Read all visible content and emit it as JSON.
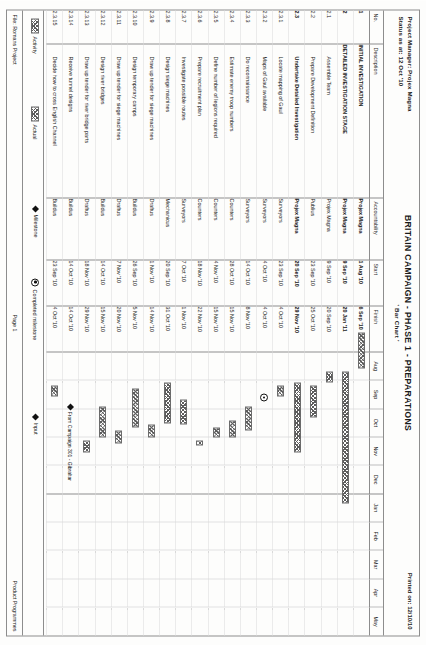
{
  "header": {
    "project_manager": "Project Manager: Projex Magna",
    "status_as_at": "Status as at: 12 Oct '10",
    "title": "BRITAIN CAMPAIGN - PHASE 1 - PREPARATIONS",
    "subtitle": "' Bar Chart '",
    "printed_on": "Printed on: 12/10/10"
  },
  "columns": {
    "no": "No.",
    "description": "Description",
    "accountability": "Accountability",
    "start": "Start",
    "finish": "Finish"
  },
  "timeline": {
    "months": [
      "Aug",
      "Sep",
      "Oct",
      "Nov",
      "Dec",
      "Jan",
      "Feb",
      "Mar",
      "Apr",
      "May"
    ],
    "year_split_after": "Dec"
  },
  "rows": [
    {
      "no": "1",
      "desc": "INITIAL INVESTIGATION",
      "acc": "Projex Magna",
      "start": "1 Aug '10",
      "finish": "6 Sep '10",
      "bold": true,
      "indent": 0
    },
    {
      "no": "2",
      "desc": "DETAILED INVESTIGATION STAGE",
      "acc": "Projex Magna",
      "start": "9 Sep '10",
      "finish": "20 Jan '11",
      "bold": true,
      "indent": 0
    },
    {
      "no": "2.1",
      "desc": "Assemble Team",
      "acc": "Projex Magna",
      "start": "9 Sep '10",
      "finish": "20 Sep '10",
      "bold": false,
      "indent": 1
    },
    {
      "no": "2.2",
      "desc": "Prepare Development Definition",
      "acc": "Publius",
      "start": "23 Sep '10",
      "finish": "25 Oct '10",
      "bold": false,
      "indent": 1
    },
    {
      "no": "2.3",
      "desc": "Undertake Detailed Investigation",
      "acc": "Projex Magna",
      "start": "20 Sep '10",
      "finish": "29 Nov '10",
      "bold": true,
      "indent": 1
    },
    {
      "no": "2.3.1",
      "desc": "Locate mapping of Gaul",
      "acc": "Surveyors",
      "start": "23 Sep '10",
      "finish": "4 Oct '10",
      "bold": false,
      "indent": 1
    },
    {
      "no": "2.3.2",
      "desc": "Maps of Gaul available",
      "acc": "Surveyors",
      "start": "4 Oct '10",
      "finish": "4 Oct '10",
      "bold": false,
      "indent": 1
    },
    {
      "no": "2.3.3",
      "desc": "Do reconnaissance",
      "acc": "Surveyors",
      "start": "14 Oct '10",
      "finish": "8 Nov '10",
      "bold": false,
      "indent": 1
    },
    {
      "no": "2.3.4",
      "desc": "Estimate enemy troop numbers",
      "acc": "Counters",
      "start": "28 Oct '10",
      "finish": "15 Nov '10",
      "bold": false,
      "indent": 1
    },
    {
      "no": "2.3.5",
      "desc": "Define number of legions required",
      "acc": "Counters",
      "start": "4 Nov '10",
      "finish": "15 Nov '10",
      "bold": false,
      "indent": 1
    },
    {
      "no": "2.3.6",
      "desc": "Prepare recruitment plan",
      "acc": "Counters",
      "start": "18 Nov '10",
      "finish": "22 Nov '10",
      "bold": false,
      "indent": 1
    },
    {
      "no": "2.3.7",
      "desc": "Investigate possible routes",
      "acc": "Surveyors",
      "start": "7 Oct '10",
      "finish": "1 Nov '10",
      "bold": false,
      "indent": 1
    },
    {
      "no": "2.3.8",
      "desc": "Design siege machines",
      "acc": "Mechanicus",
      "start": "20 Sep '10",
      "finish": "31 Oct '10",
      "bold": false,
      "indent": 1
    },
    {
      "no": "2.3.9",
      "desc": "Draw up tender for siege machines",
      "acc": "Draftus",
      "start": "1 Nov '10",
      "finish": "14 Nov '10",
      "bold": false,
      "indent": 1
    },
    {
      "no": "2.3.10",
      "desc": "Design temporary camps",
      "acc": "Buildus",
      "start": "26 Sep '10",
      "finish": "5 Nov '10",
      "bold": false,
      "indent": 1
    },
    {
      "no": "2.3.11",
      "desc": "Draw up tender for siege machines",
      "acc": "Draftus",
      "start": "7 Nov '10",
      "finish": "20 Nov '10",
      "bold": false,
      "indent": 1
    },
    {
      "no": "2.3.12",
      "desc": "Design river bridges",
      "acc": "Buildus",
      "start": "14 Oct '10",
      "finish": "15 Nov '10",
      "bold": false,
      "indent": 1
    },
    {
      "no": "2.3.13",
      "desc": "Draw up tender for river bridge parts",
      "acc": "Draftus",
      "start": "18 Nov '10",
      "finish": "29 Nov '10",
      "bold": false,
      "indent": 1
    },
    {
      "no": "2.3.14",
      "desc": "Receive tunnel designs",
      "acc": "Buildus",
      "start": "14 Oct '10",
      "finish": "14 Oct '10",
      "bold": false,
      "indent": 1
    },
    {
      "no": "2.3.15",
      "desc": "Decide how to cross English Channel",
      "acc": "Buildus",
      "start": "23 Sep '10",
      "finish": "4 Oct '10",
      "bold": false,
      "indent": 1
    }
  ],
  "bars": [
    {
      "row": 0,
      "type": "bar",
      "start_m": 0.0,
      "end_m": 1.2
    },
    {
      "row": 1,
      "type": "bar",
      "start_m": 1.3,
      "end_m": 5.65
    },
    {
      "row": 2,
      "type": "bar",
      "start_m": 1.3,
      "end_m": 1.65
    },
    {
      "row": 3,
      "type": "bar",
      "start_m": 1.75,
      "end_m": 2.8
    },
    {
      "row": 4,
      "type": "bar",
      "start_m": 1.65,
      "end_m": 3.95
    },
    {
      "row": 5,
      "type": "bar",
      "start_m": 1.75,
      "end_m": 2.12
    },
    {
      "row": 6,
      "type": "milestone_done",
      "start_m": 2.12
    },
    {
      "row": 7,
      "type": "bar",
      "start_m": 2.45,
      "end_m": 3.25
    },
    {
      "row": 8,
      "type": "bar",
      "start_m": 2.9,
      "end_m": 3.48
    },
    {
      "row": 9,
      "type": "bar",
      "start_m": 3.12,
      "end_m": 3.48
    },
    {
      "row": 10,
      "type": "bar",
      "start_m": 3.58,
      "end_m": 3.72
    },
    {
      "row": 11,
      "type": "bar",
      "start_m": 2.22,
      "end_m": 3.02
    },
    {
      "row": 12,
      "type": "bar",
      "start_m": 1.65,
      "end_m": 3.0
    },
    {
      "row": 13,
      "type": "bar",
      "start_m": 3.02,
      "end_m": 3.45
    },
    {
      "row": 14,
      "type": "bar",
      "start_m": 1.85,
      "end_m": 3.15
    },
    {
      "row": 15,
      "type": "bar",
      "start_m": 3.22,
      "end_m": 3.65
    },
    {
      "row": 16,
      "type": "bar",
      "start_m": 2.45,
      "end_m": 3.48
    },
    {
      "row": 17,
      "type": "bar",
      "start_m": 3.58,
      "end_m": 3.95
    },
    {
      "row": 18,
      "type": "milestone",
      "start_m": 2.45
    },
    {
      "row": 19,
      "type": "bar",
      "start_m": 1.75,
      "end_m": 2.12
    }
  ],
  "annotation": {
    "text": "From Campaign 301 - Gibraltar",
    "row": 18
  },
  "legend": [
    {
      "label": "Activity",
      "symbol": "hatched-bar"
    },
    {
      "label": "Actual",
      "symbol": "hatched-bar"
    },
    {
      "label": "Milestone",
      "symbol": "filled-diamond"
    },
    {
      "label": "Completed milestone",
      "symbol": "dotted-circle"
    },
    {
      "label": "Input",
      "symbol": "filled-diamond"
    }
  ],
  "footer": {
    "file": "File: Romans Project",
    "page": "Page 1",
    "product": "Product Programmes"
  }
}
